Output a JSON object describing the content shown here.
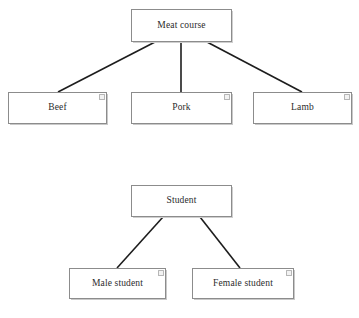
{
  "diagram": {
    "title": "",
    "background_color": "#ffffff",
    "box_border_color": "#8c8c8c",
    "edge_color": "#1d1d1d",
    "text_color": "#2b2b2b",
    "groups": [
      {
        "name": "meat-course-hierarchy",
        "root": {
          "id": "meat-course",
          "label": "Meat course",
          "x": 131,
          "y": 9,
          "w": 101,
          "h": 33
        },
        "children": [
          {
            "id": "beef",
            "label": "Beef",
            "x": 8,
            "y": 92,
            "w": 99,
            "h": 32,
            "handle": true
          },
          {
            "id": "pork",
            "label": "Pork",
            "x": 131,
            "y": 92,
            "w": 101,
            "h": 32,
            "handle": true
          },
          {
            "id": "lamb",
            "label": "Lamb",
            "x": 253,
            "y": 92,
            "w": 99,
            "h": 32,
            "handle": true
          }
        ],
        "edges": [
          {
            "from": "meat-course",
            "to": "beef",
            "x1": 155,
            "y1": 42,
            "x2": 58,
            "y2": 92
          },
          {
            "from": "meat-course",
            "to": "pork",
            "x1": 181,
            "y1": 42,
            "x2": 181,
            "y2": 92
          },
          {
            "from": "meat-course",
            "to": "lamb",
            "x1": 207,
            "y1": 42,
            "x2": 302,
            "y2": 92
          }
        ]
      },
      {
        "name": "student-hierarchy",
        "root": {
          "id": "student",
          "label": "Student",
          "x": 131,
          "y": 185,
          "w": 101,
          "h": 32
        },
        "children": [
          {
            "id": "male-student",
            "label": "Male student",
            "x": 69,
            "y": 268,
            "w": 97,
            "h": 31,
            "handle": true
          },
          {
            "id": "female-student",
            "label": "Female student",
            "x": 192,
            "y": 268,
            "w": 102,
            "h": 31,
            "handle": true
          }
        ],
        "edges": [
          {
            "from": "student",
            "to": "male-student",
            "x1": 163,
            "y1": 217,
            "x2": 117,
            "y2": 268
          },
          {
            "from": "student",
            "to": "female-student",
            "x1": 200,
            "y1": 217,
            "x2": 240,
            "y2": 268
          }
        ]
      }
    ]
  }
}
